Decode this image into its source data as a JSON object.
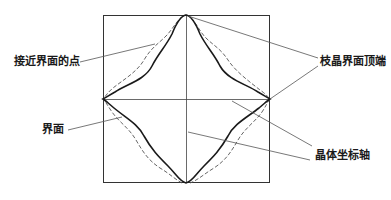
{
  "diagram": {
    "title": "",
    "labels": {
      "near_interface_point": "接近界面的点",
      "dendrite_tip": "枝晶界面顶端",
      "interface": "界面",
      "crystal_axis": "晶体坐标轴"
    },
    "colors": {
      "line": "#1a1a1a",
      "leader": "#555555",
      "frame": "#333333"
    }
  }
}
